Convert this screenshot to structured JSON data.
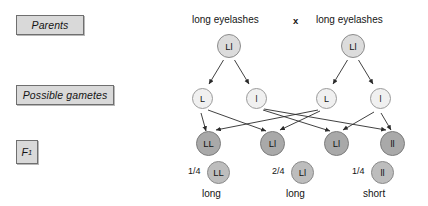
{
  "diagram": {
    "title_type": "monohybrid-genetic-cross",
    "stage_labels": [
      {
        "id": "parents",
        "text": "Parents"
      },
      {
        "id": "gametes",
        "text": "Possible gametes"
      },
      {
        "id": "f1",
        "text": "F",
        "subscript": "1"
      }
    ],
    "parents": {
      "cross_symbol": "x",
      "individuals": [
        {
          "phenotype": "long eyelashes",
          "genotype": "Ll"
        },
        {
          "phenotype": "long eyelashes",
          "genotype": "Ll"
        }
      ]
    },
    "gametes": [
      {
        "allele": "L",
        "from_parent": 0
      },
      {
        "allele": "l",
        "from_parent": 0
      },
      {
        "allele": "L",
        "from_parent": 1
      },
      {
        "allele": "l",
        "from_parent": 1
      }
    ],
    "f1_offspring": [
      {
        "genotype": "LL"
      },
      {
        "genotype": "Ll"
      },
      {
        "genotype": "Ll"
      },
      {
        "genotype": "ll"
      }
    ],
    "f1_summary": [
      {
        "ratio": "1/4",
        "ratio_numerator": "1",
        "ratio_denominator": "4",
        "genotype": "LL",
        "phenotype": "long"
      },
      {
        "ratio": "2/4",
        "ratio_numerator": "2",
        "ratio_denominator": "4",
        "genotype": "Ll",
        "phenotype": "long"
      },
      {
        "ratio": "1/4",
        "ratio_numerator": "1",
        "ratio_denominator": "4",
        "genotype": "ll",
        "phenotype": "short"
      }
    ],
    "colors": {
      "background": "#ffffff",
      "label_box_fill": "#d9d9d9",
      "label_box_border": "#6f6f6f",
      "parent_circle_fill": "#dcdcdc",
      "gamete_circle_fill": "#f0f0f0",
      "f1_circle_fill": "#a9a9a9",
      "ratio_circle_fill": "#bdbdbd",
      "line": "#2b2b2b",
      "text": "#141414"
    }
  }
}
